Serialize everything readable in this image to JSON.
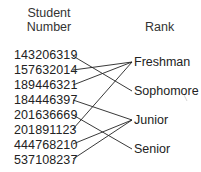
{
  "headers": {
    "left": [
      "Student",
      "Number"
    ],
    "right": "Rank"
  },
  "students": [
    {
      "number": "143206319",
      "rank": "Sophomore"
    },
    {
      "number": "157632014",
      "rank": "Freshman"
    },
    {
      "number": "189446321",
      "rank": "Freshman"
    },
    {
      "number": "184446397",
      "rank": "Junior"
    },
    {
      "number": "201636669",
      "rank": "Senior"
    },
    {
      "number": "201891123",
      "rank": "Freshman"
    },
    {
      "number": "444768210",
      "rank": "Junior"
    },
    {
      "number": "537108237",
      "rank": "Junior"
    }
  ],
  "ranks": [
    "Freshman",
    "Sophomore",
    "Junior",
    "Senior"
  ],
  "line_color": "#222222"
}
